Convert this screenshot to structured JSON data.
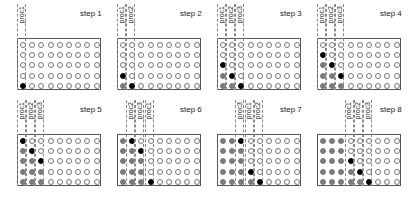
{
  "figure": {
    "rows": 5,
    "cols": 9,
    "legend": {
      "0": "empty",
      "1": "completed (gray)",
      "2": "active (black)"
    },
    "colors": {
      "empty": "#ffffff",
      "completed": "#7a7a7a",
      "active": "#000000"
    },
    "steps": [
      {
        "label": "step 1",
        "procs": [
          {
            "name": "proc1",
            "col": 0
          }
        ],
        "grid": [
          [
            0,
            0,
            0,
            0,
            0,
            0,
            0,
            0,
            0
          ],
          [
            0,
            0,
            0,
            0,
            0,
            0,
            0,
            0,
            0
          ],
          [
            0,
            0,
            0,
            0,
            0,
            0,
            0,
            0,
            0
          ],
          [
            0,
            0,
            0,
            0,
            0,
            0,
            0,
            0,
            0
          ],
          [
            2,
            0,
            0,
            0,
            0,
            0,
            0,
            0,
            0
          ]
        ]
      },
      {
        "label": "step 2",
        "procs": [
          {
            "name": "proc1",
            "col": 0
          },
          {
            "name": "proc2",
            "col": 1
          }
        ],
        "grid": [
          [
            0,
            0,
            0,
            0,
            0,
            0,
            0,
            0,
            0
          ],
          [
            0,
            0,
            0,
            0,
            0,
            0,
            0,
            0,
            0
          ],
          [
            0,
            0,
            0,
            0,
            0,
            0,
            0,
            0,
            0
          ],
          [
            2,
            0,
            0,
            0,
            0,
            0,
            0,
            0,
            0
          ],
          [
            1,
            2,
            0,
            0,
            0,
            0,
            0,
            0,
            0
          ]
        ]
      },
      {
        "label": "step 3",
        "procs": [
          {
            "name": "proc1",
            "col": 0
          },
          {
            "name": "proc2",
            "col": 1
          },
          {
            "name": "proc3",
            "col": 2
          }
        ],
        "grid": [
          [
            0,
            0,
            0,
            0,
            0,
            0,
            0,
            0,
            0
          ],
          [
            0,
            0,
            0,
            0,
            0,
            0,
            0,
            0,
            0
          ],
          [
            2,
            0,
            0,
            0,
            0,
            0,
            0,
            0,
            0
          ],
          [
            1,
            2,
            0,
            0,
            0,
            0,
            0,
            0,
            0
          ],
          [
            1,
            1,
            2,
            0,
            0,
            0,
            0,
            0,
            0
          ]
        ]
      },
      {
        "label": "step 4",
        "procs": [
          {
            "name": "proc1",
            "col": 0
          },
          {
            "name": "proc2",
            "col": 1
          },
          {
            "name": "proc3",
            "col": 2
          }
        ],
        "grid": [
          [
            0,
            0,
            0,
            0,
            0,
            0,
            0,
            0,
            0
          ],
          [
            2,
            0,
            0,
            0,
            0,
            0,
            0,
            0,
            0
          ],
          [
            1,
            2,
            0,
            0,
            0,
            0,
            0,
            0,
            0
          ],
          [
            1,
            1,
            2,
            0,
            0,
            0,
            0,
            0,
            0
          ],
          [
            1,
            1,
            1,
            0,
            0,
            0,
            0,
            0,
            0
          ]
        ]
      },
      {
        "label": "step 5",
        "procs": [
          {
            "name": "proc1",
            "col": 0
          },
          {
            "name": "proc2",
            "col": 1
          },
          {
            "name": "proc3",
            "col": 2
          }
        ],
        "grid": [
          [
            2,
            0,
            0,
            0,
            0,
            0,
            0,
            0,
            0
          ],
          [
            1,
            2,
            0,
            0,
            0,
            0,
            0,
            0,
            0
          ],
          [
            1,
            1,
            2,
            0,
            0,
            0,
            0,
            0,
            0
          ],
          [
            1,
            1,
            1,
            0,
            0,
            0,
            0,
            0,
            0
          ],
          [
            1,
            1,
            1,
            0,
            0,
            0,
            0,
            0,
            0
          ]
        ]
      },
      {
        "label": "step 6",
        "procs": [
          {
            "name": "proc2",
            "col": 1
          },
          {
            "name": "proc3",
            "col": 2
          },
          {
            "name": "proc1",
            "col": 3
          }
        ],
        "grid": [
          [
            1,
            2,
            0,
            0,
            0,
            0,
            0,
            0,
            0
          ],
          [
            1,
            1,
            2,
            0,
            0,
            0,
            0,
            0,
            0
          ],
          [
            1,
            1,
            1,
            0,
            0,
            0,
            0,
            0,
            0
          ],
          [
            1,
            1,
            1,
            0,
            0,
            0,
            0,
            0,
            0
          ],
          [
            1,
            1,
            1,
            2,
            0,
            0,
            0,
            0,
            0
          ]
        ]
      },
      {
        "label": "step 7",
        "procs": [
          {
            "name": "proc3",
            "col": 2
          },
          {
            "name": "proc1",
            "col": 3
          },
          {
            "name": "proc2",
            "col": 4
          }
        ],
        "grid": [
          [
            1,
            1,
            2,
            0,
            0,
            0,
            0,
            0,
            0
          ],
          [
            1,
            1,
            1,
            0,
            0,
            0,
            0,
            0,
            0
          ],
          [
            1,
            1,
            1,
            0,
            0,
            0,
            0,
            0,
            0
          ],
          [
            1,
            1,
            1,
            2,
            0,
            0,
            0,
            0,
            0
          ],
          [
            1,
            1,
            1,
            1,
            2,
            0,
            0,
            0,
            0
          ]
        ]
      },
      {
        "label": "step 8",
        "procs": [
          {
            "name": "proc1",
            "col": 3
          },
          {
            "name": "proc2",
            "col": 4
          },
          {
            "name": "proc3",
            "col": 5
          }
        ],
        "grid": [
          [
            1,
            1,
            1,
            0,
            0,
            0,
            0,
            0,
            0
          ],
          [
            1,
            1,
            1,
            0,
            0,
            0,
            0,
            0,
            0
          ],
          [
            1,
            1,
            1,
            2,
            0,
            0,
            0,
            0,
            0
          ],
          [
            1,
            1,
            1,
            1,
            2,
            0,
            0,
            0,
            0
          ],
          [
            1,
            1,
            1,
            1,
            1,
            2,
            0,
            0,
            0
          ]
        ]
      }
    ]
  }
}
